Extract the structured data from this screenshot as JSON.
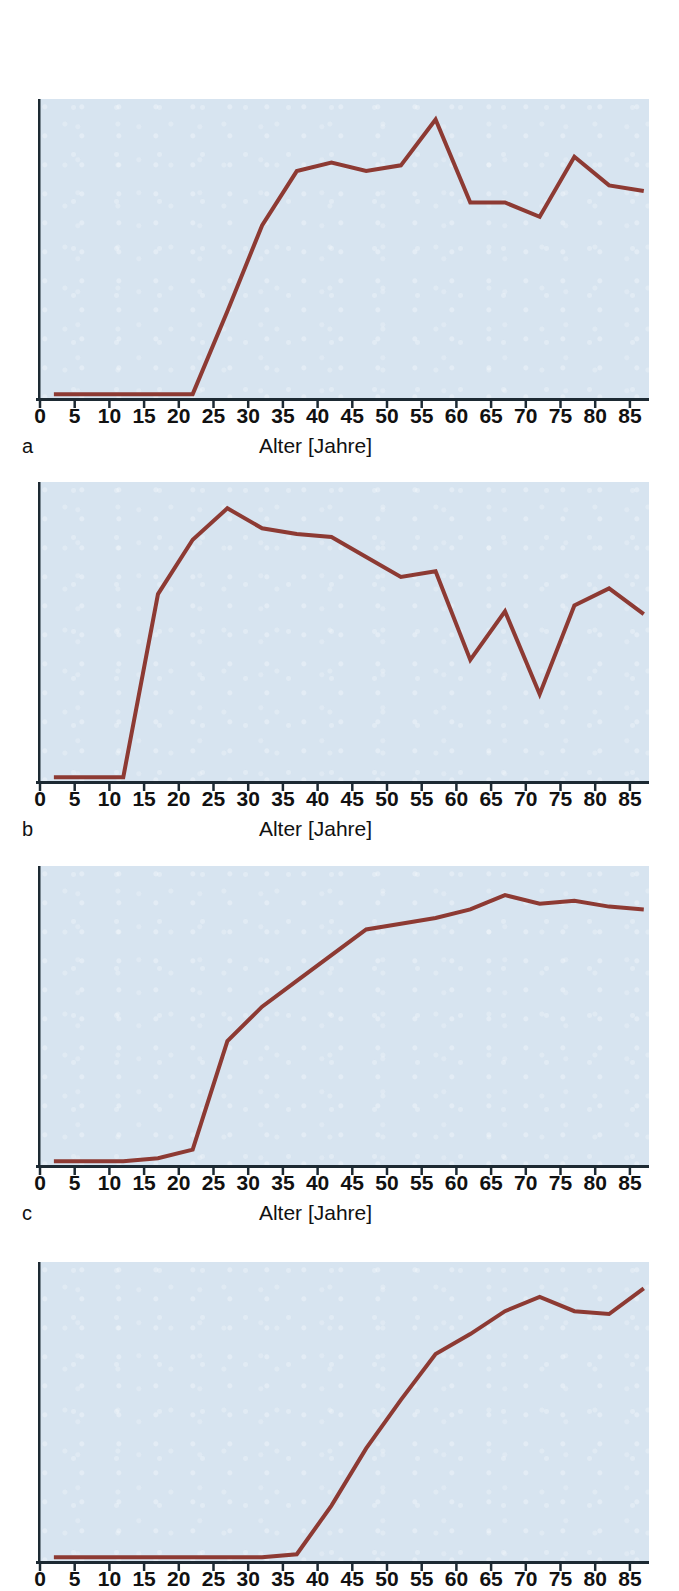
{
  "figure": {
    "axis_title": "Alter [Jahre]",
    "line_color": "#8d3a33",
    "plot_background": "#d7e4f0",
    "axis_color": "#1d2a33",
    "tick_labels": [
      "0",
      "5",
      "10",
      "15",
      "20",
      "25",
      "30",
      "35",
      "40",
      "45",
      "50",
      "55",
      "60",
      "65",
      "70",
      "75",
      "80",
      "85"
    ]
  },
  "chart_data": [
    {
      "id": "a",
      "type": "line",
      "panel_label": "a",
      "title": "",
      "xlabel": "Alter [Jahre]",
      "ylabel": "",
      "xlim": [
        0,
        87
      ],
      "ylim": [
        0,
        100
      ],
      "grid": false,
      "legend": "none",
      "x": [
        2,
        7,
        12,
        17,
        22,
        27,
        32,
        37,
        42,
        47,
        52,
        57,
        62,
        67,
        72,
        77,
        82,
        87
      ],
      "values": [
        1,
        1,
        1,
        1,
        1,
        30,
        60,
        79,
        82,
        79,
        81,
        97,
        68,
        68,
        63,
        84,
        74,
        72
      ]
    },
    {
      "id": "b",
      "type": "line",
      "panel_label": "b",
      "title": "",
      "xlabel": "Alter [Jahre]",
      "ylabel": "",
      "xlim": [
        0,
        87
      ],
      "ylim": [
        0,
        100
      ],
      "grid": false,
      "legend": "none",
      "x": [
        2,
        7,
        12,
        17,
        22,
        27,
        32,
        37,
        42,
        47,
        52,
        57,
        62,
        67,
        72,
        77,
        82,
        87
      ],
      "values": [
        1,
        1,
        1,
        65,
        84,
        95,
        88,
        86,
        85,
        78,
        71,
        73,
        42,
        59,
        30,
        61,
        67,
        58
      ]
    },
    {
      "id": "c",
      "type": "line",
      "panel_label": "c",
      "title": "",
      "xlabel": "Alter [Jahre]",
      "ylabel": "",
      "xlim": [
        0,
        87
      ],
      "ylim": [
        0,
        100
      ],
      "grid": false,
      "legend": "none",
      "x": [
        2,
        7,
        12,
        17,
        22,
        27,
        32,
        37,
        42,
        47,
        52,
        57,
        62,
        67,
        72,
        77,
        82,
        87
      ],
      "values": [
        1,
        1,
        1,
        2,
        5,
        43,
        55,
        64,
        73,
        82,
        84,
        86,
        89,
        94,
        91,
        92,
        90,
        89
      ]
    },
    {
      "id": "d",
      "type": "line",
      "panel_label": "d",
      "title": "",
      "xlabel": "Alter [Jahre]",
      "ylabel": "",
      "xlim": [
        0,
        87
      ],
      "ylim": [
        0,
        100
      ],
      "grid": false,
      "legend": "none",
      "x": [
        2,
        7,
        12,
        17,
        22,
        27,
        32,
        37,
        42,
        47,
        52,
        57,
        62,
        67,
        72,
        77,
        82,
        87
      ],
      "values": [
        1,
        1,
        1,
        1,
        1,
        1,
        1,
        2,
        19,
        39,
        56,
        72,
        79,
        87,
        92,
        87,
        86,
        95
      ]
    }
  ],
  "panels": [
    {
      "letter": "a",
      "axis_title": "Alter [Jahre]"
    },
    {
      "letter": "b",
      "axis_title": "Alter [Jahre]"
    },
    {
      "letter": "c",
      "axis_title": "Alter [Jahre]"
    },
    {
      "letter": "d",
      "axis_title": ""
    }
  ]
}
